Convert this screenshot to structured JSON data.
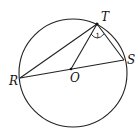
{
  "diagram": {
    "type": "circle-geometry",
    "circle": {
      "cx": 73,
      "cy": 73,
      "r": 54
    },
    "points": {
      "T": {
        "label": "T",
        "x": 97,
        "y": 24
      },
      "S": {
        "label": "S",
        "x": 124,
        "y": 60
      },
      "R": {
        "label": "R",
        "x": 20,
        "y": 78
      },
      "O": {
        "label": "O",
        "x": 71,
        "y": 69
      }
    },
    "segments": [
      "RT",
      "TO",
      "TS",
      "RS"
    ],
    "angle_marker": {
      "vertex": "T",
      "label": "1"
    }
  }
}
